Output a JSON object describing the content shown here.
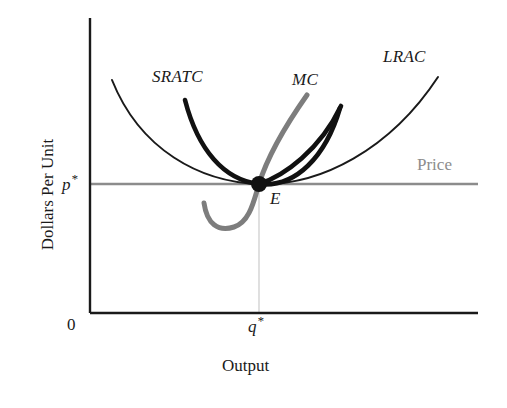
{
  "figure": {
    "type": "economics-cost-curve-diagram",
    "background": "#ffffff"
  },
  "axes": {
    "y_label": "Dollars Per Unit",
    "x_label": "Output",
    "origin_label": "0",
    "y_tick_label": "p",
    "y_tick_star": "*",
    "x_tick_label": "q",
    "x_tick_star": "*",
    "axis_color": "#1a1a1a",
    "x_axis_y": 313,
    "y_axis_x": 90,
    "x_axis_right": 478,
    "y_axis_top": 18
  },
  "equilibrium": {
    "label": "E",
    "x": 259,
    "y": 184,
    "dot_radius": 8,
    "dot_color": "#111111"
  },
  "price_line": {
    "label": "Price",
    "color": "#8c8c8c",
    "y": 184,
    "x_start": 90,
    "x_end": 478
  },
  "guide_line": {
    "color": "#d8d8d8",
    "x": 259,
    "y_start": 190,
    "y_end": 313
  },
  "curves": [
    {
      "name": "LRAC",
      "label": "LRAC",
      "style": "thin-black",
      "color": "#1a1a1a",
      "width": 2.0,
      "description": "long-run average cost, wide U tangent to price at minimum",
      "path": "M112,80 C140,150 200,182 259,184 C320,186 390,150 438,77"
    },
    {
      "name": "SRATC",
      "label": "SRATC",
      "style": "thick-black",
      "color": "#111111",
      "width": 4.6,
      "description": "short-run average total cost, narrower U tangent to price at E",
      "path": "M185,100 C198,150 224,180 259,184 C296,188 326,156 340,108"
    },
    {
      "name": "MC",
      "label": "MC",
      "style": "thick-gray",
      "color": "#7d7d7d",
      "width": 5.0,
      "description": "marginal cost, U dipping below the price line then rising steeply through E",
      "path": "M204,203 C207,224 218,232 234,227 C250,222 254,200 259,184 C268,155 288,122 307,95"
    },
    {
      "name": "MC-black",
      "label": "MC",
      "style": "thick-black",
      "color": "#111111",
      "width": 4.6,
      "description": "second marginal cost branch rising steeply right of E",
      "path": "M259,184 C284,176 320,150 341,106"
    }
  ],
  "chart_data": {
    "type": "line",
    "title": "",
    "xlabel": "Output",
    "ylabel": "Dollars Per Unit",
    "grid": false,
    "legend": "inline-curve-labels",
    "annotations": [
      "p*",
      "q*",
      "E",
      "Price"
    ],
    "series": [
      {
        "name": "LRAC",
        "style": "thin black U-curve"
      },
      {
        "name": "SRATC",
        "style": "thick black U-curve"
      },
      {
        "name": "MC",
        "style": "thick gray rising curve"
      },
      {
        "name": "Price",
        "style": "horizontal gray line at p*"
      }
    ],
    "equilibrium_point": {
      "label": "E",
      "x": "q*",
      "y": "p*"
    },
    "xlim": [
      "0",
      "max"
    ],
    "ylim": [
      "0",
      "max"
    ]
  }
}
